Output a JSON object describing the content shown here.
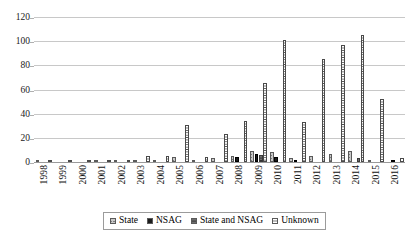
{
  "chart_data": {
    "type": "bar",
    "title": "",
    "subtitle": "",
    "xlabel": "",
    "ylabel": "",
    "ylim": [
      0,
      120
    ],
    "yticks": [
      0,
      20,
      40,
      60,
      80,
      100,
      120
    ],
    "grid": true,
    "legend_position": "bottom",
    "categories": [
      "1998",
      "1999",
      "2000",
      "2001",
      "2002",
      "2003",
      "2004",
      "2005",
      "2006",
      "2007",
      "2008",
      "2009",
      "2010",
      "2011",
      "2012",
      "2013",
      "2014",
      "2015",
      "2016"
    ],
    "series": [
      {
        "name": "State",
        "key": "state",
        "pattern": "crosshatch-gray",
        "color": "#c9c9c9",
        "values": [
          1,
          0,
          0,
          1,
          1,
          2,
          2,
          4,
          1,
          3,
          5,
          9,
          8,
          3,
          5,
          7,
          9,
          1,
          0
        ]
      },
      {
        "name": "NSAG",
        "key": "nsag",
        "pattern": "solid-black",
        "color": "#1c1c1c",
        "values": [
          0,
          0,
          0,
          0,
          0,
          0,
          0,
          0,
          0,
          0,
          4,
          7,
          4,
          1,
          0,
          0,
          0,
          0,
          1
        ]
      },
      {
        "name": "State and NSAG",
        "key": "state_and_nsag",
        "pattern": "horizontal-dark-gray",
        "color": "#6e6e6e",
        "values": [
          0,
          0,
          0,
          0,
          0,
          0,
          0,
          0,
          0,
          0,
          0,
          6,
          0,
          0,
          0,
          0,
          3,
          0,
          0
        ]
      },
      {
        "name": "Unknown",
        "key": "unknown",
        "pattern": "horizontal-stripes-white",
        "color": "#ffffff",
        "values": [
          2,
          1,
          1,
          2,
          2,
          5,
          5,
          31,
          4,
          23,
          34,
          65,
          101,
          33,
          85,
          97,
          105,
          52,
          3
        ]
      }
    ]
  },
  "legend": {
    "items": [
      {
        "label": "State",
        "key": "state"
      },
      {
        "label": "NSAG",
        "key": "nsag"
      },
      {
        "label": "State and NSAG",
        "key": "state_and_nsag"
      },
      {
        "label": "Unknown",
        "key": "unknown"
      }
    ]
  }
}
